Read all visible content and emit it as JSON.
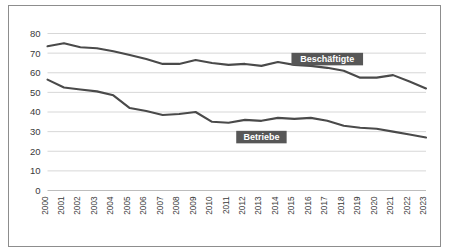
{
  "chart_data": {
    "type": "line",
    "title": "",
    "xlabel": "",
    "ylabel": "",
    "ylim": [
      0,
      80
    ],
    "yticks": [
      0,
      10,
      20,
      30,
      40,
      50,
      60,
      70,
      80
    ],
    "grid": true,
    "legend_position": "inline-labels",
    "categories": [
      "2000",
      "2001",
      "2002",
      "2003",
      "2004",
      "2005",
      "2006",
      "2007",
      "2008",
      "2009",
      "2010",
      "2011",
      "2012",
      "2013",
      "2014",
      "2015",
      "2016",
      "2017",
      "2018",
      "2019",
      "2020",
      "2021",
      "2022",
      "2023"
    ],
    "series": [
      {
        "name": "Beschäftigte",
        "color": "#4a4a4a",
        "label_color": "#575757",
        "values": [
          73.5,
          75.0,
          73.0,
          72.5,
          71.0,
          69.0,
          67.0,
          64.5,
          64.5,
          66.5,
          65.0,
          64.0,
          64.5,
          63.5,
          65.5,
          64.0,
          63.5,
          62.5,
          61.0,
          57.5,
          57.5,
          58.8,
          55.5,
          52.0
        ]
      },
      {
        "name": "Betriebe",
        "color": "#4a4a4a",
        "label_color": "#575757",
        "values": [
          56.5,
          52.5,
          51.5,
          50.5,
          48.5,
          42.0,
          40.5,
          38.5,
          39.0,
          40.0,
          35.0,
          34.5,
          36.0,
          35.5,
          37.0,
          36.5,
          37.0,
          35.5,
          33.0,
          32.0,
          31.5,
          30.0,
          28.5,
          27.0
        ]
      }
    ],
    "annotations": [
      {
        "text": "Beschäftigte",
        "series": 0,
        "at_x": "2017"
      },
      {
        "text": "Betriebe",
        "series": 1,
        "at_x": "2013"
      }
    ]
  },
  "colors": {
    "line": "#4a4a4a",
    "grid": "#d2d2d2",
    "border": "#8d8d8d",
    "label_bg": "#575757",
    "label_fg": "#ffffff",
    "text": "#3a3a3a",
    "background": "#ffffff"
  }
}
